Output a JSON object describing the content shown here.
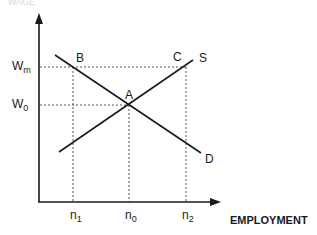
{
  "diagram": {
    "y_axis_title_cropped": "WAGE",
    "x_axis_title": "EMPLOYMENT",
    "y_ticks": [
      {
        "base": "W",
        "sub": "m"
      },
      {
        "base": "W",
        "sub": "0"
      }
    ],
    "x_ticks": [
      {
        "base": "n",
        "sub": "1"
      },
      {
        "base": "n",
        "sub": "0"
      },
      {
        "base": "n",
        "sub": "2"
      }
    ],
    "points": {
      "A": "A",
      "B": "B",
      "C": "C"
    },
    "curves": {
      "supply": "S",
      "demand": "D"
    },
    "colors": {
      "line": "#1a1a1a",
      "guide": "#555555",
      "background": "#ffffff"
    }
  }
}
